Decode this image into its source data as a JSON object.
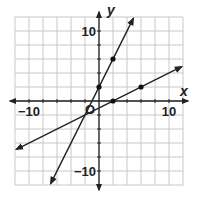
{
  "chart_data": {
    "type": "line",
    "title": "",
    "xlabel": "x",
    "ylabel": "y",
    "origin_label": "O",
    "xlim": [
      -12,
      12
    ],
    "ylim": [
      -12,
      12
    ],
    "grid": true,
    "grid_step": 2,
    "x_tick_labels": [
      {
        "value": -10,
        "label": "−10"
      },
      {
        "value": 10,
        "label": "10"
      }
    ],
    "y_tick_labels": [
      {
        "value": 10,
        "label": "10"
      },
      {
        "value": -10,
        "label": "−10"
      }
    ],
    "series": [
      {
        "name": "steep line",
        "equation": "y = 2x + 2",
        "slope": 2,
        "intercept": 2,
        "marked_points": [
          [
            0,
            2
          ],
          [
            2,
            6
          ]
        ],
        "x_range": [
          -6.9,
          4.9
        ]
      },
      {
        "name": "shallow line",
        "equation": "y = 0.5x - 1",
        "slope": 0.5,
        "intercept": -1,
        "marked_points": [
          [
            2,
            0
          ],
          [
            6,
            2
          ]
        ],
        "x_range": [
          -11.8,
          11.8
        ]
      }
    ],
    "colors": {
      "line": "#222222",
      "grid": "#c8c8c8",
      "axis": "#222222"
    }
  }
}
